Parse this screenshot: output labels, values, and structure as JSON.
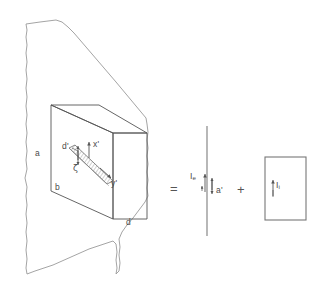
{
  "figure": {
    "type": "hand-drawn physics schematic",
    "background_color": "#ffffff",
    "ink_color": "#555555",
    "label_color": "#4a4a4a"
  },
  "left_panel": {
    "name": "slab-in-plane",
    "plane_label": "irregular hand-drawn plane",
    "box_labels": {
      "a": "a",
      "b": "b",
      "d": "d"
    },
    "inner_slab_labels": {
      "d_prime": "d'",
      "x_prime": "x'",
      "y_prime": "y'",
      "zeta": "ζ"
    }
  },
  "operators": {
    "equals": "=",
    "plus": "+"
  },
  "middle_panel": {
    "name": "current-sheet",
    "labels": {
      "I_e_base": "I",
      "I_e_sub": "e",
      "a_prime": "a'"
    }
  },
  "right_panel": {
    "name": "interior-current-block",
    "labels": {
      "I_i_base": "I",
      "I_i_sub": "i"
    }
  }
}
